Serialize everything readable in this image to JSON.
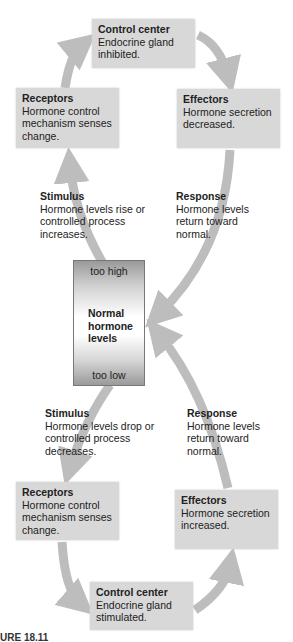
{
  "top_loop": {
    "control_center": {
      "title": "Control center",
      "line1": "Endocrine gland",
      "line2": "inhibited."
    },
    "receptors": {
      "title": "Receptors",
      "line1": "Hormone control",
      "line2": "mechanism senses",
      "line3": "change."
    },
    "effectors": {
      "title": "Effectors",
      "line1": "Hormone secretion",
      "line2": "decreased."
    },
    "stimulus": {
      "title": "Stimulus",
      "line1": "Hormone levels rise or",
      "line2": "controlled process",
      "line3": "increases."
    },
    "response": {
      "title": "Response",
      "line1": "Hormone levels",
      "line2": "return toward",
      "line3": "normal."
    }
  },
  "center": {
    "too_high": "too high",
    "label1": "Normal",
    "label2": "hormone",
    "label3": "levels",
    "too_low": "too low"
  },
  "bottom_loop": {
    "stimulus": {
      "title": "Stimulus",
      "line1": "Hormone levels drop or",
      "line2": "controlled process",
      "line3": "decreases."
    },
    "response": {
      "title": "Response",
      "line1": "Hormone levels",
      "line2": "return toward",
      "line3": "normal."
    },
    "receptors": {
      "title": "Receptors",
      "line1": "Hormone control",
      "line2": "mechanism senses",
      "line3": "change."
    },
    "effectors": {
      "title": "Effectors",
      "line1": "Hormone secretion",
      "line2": "increased."
    },
    "control_center": {
      "title": "Control center",
      "line1": "Endocrine gland",
      "line2": "stimulated."
    }
  },
  "figure_label": "URE 18.11",
  "colors": {
    "arrow": "#bdbdbd",
    "box": "#d8d8d8"
  }
}
